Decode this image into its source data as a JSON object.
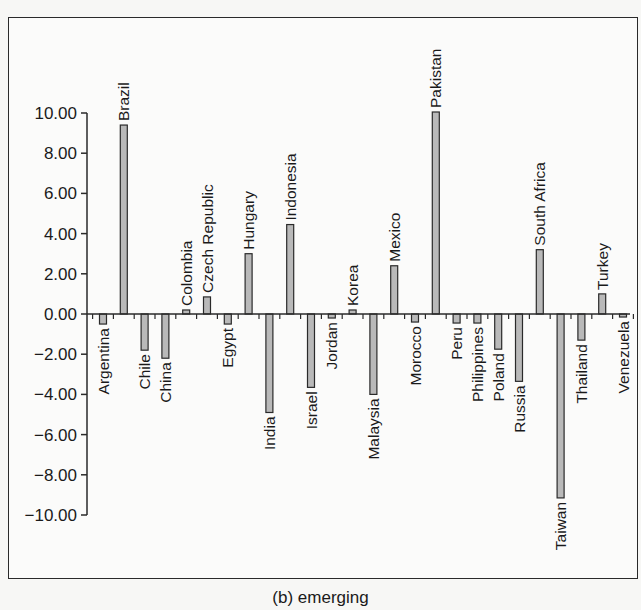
{
  "caption": "(b) emerging",
  "colors": {
    "bar_fill": "#b9b9b9",
    "bar_stroke": "#2a2a2a",
    "axis": "#2a2a2a",
    "text": "#1a1a1a"
  },
  "chart_data": {
    "type": "bar",
    "title": "(b) emerging",
    "xlabel": "",
    "ylabel": "",
    "ylim": [
      -10,
      10
    ],
    "yticks": [
      10,
      8,
      6,
      4,
      2,
      0,
      -2,
      -4,
      -6,
      -8,
      -10
    ],
    "ytick_labels": [
      "10.00",
      "8.00",
      "6.00",
      "4.00",
      "2.00",
      "0.00",
      "−2.00",
      "−4.00",
      "−6.00",
      "−8.00",
      "−10.00"
    ],
    "grid": false,
    "legend": null,
    "categories": [
      "Argentina",
      "Brazil",
      "Chile",
      "China",
      "Colombia",
      "Czech Republic",
      "Egypt",
      "Hungary",
      "India",
      "Indonesia",
      "Israel",
      "Jordan",
      "Korea",
      "Malaysia",
      "Mexico",
      "Morocco",
      "Pakistan",
      "Peru",
      "Philippines",
      "Poland",
      "Russia",
      "South Africa",
      "Taiwan",
      "Thailand",
      "Turkey",
      "Venezuela"
    ],
    "values": [
      -0.5,
      9.4,
      -1.8,
      -2.2,
      0.2,
      0.85,
      -0.5,
      3.0,
      -4.9,
      4.45,
      -3.65,
      -0.2,
      0.2,
      -4.0,
      2.4,
      -0.4,
      10.05,
      -0.45,
      -0.45,
      -1.75,
      -3.35,
      3.2,
      -9.15,
      -1.3,
      1.0,
      -0.15
    ]
  }
}
